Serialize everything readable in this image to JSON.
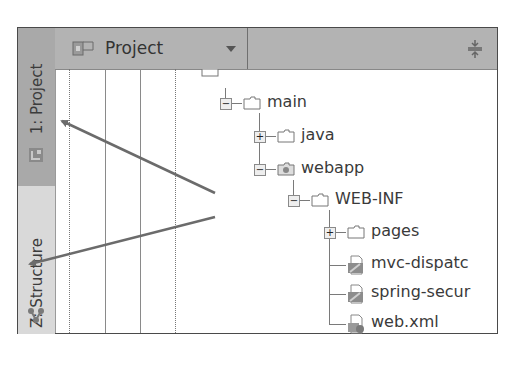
{
  "side_tabs": [
    {
      "label": "1: Project",
      "icon": "project-icon",
      "active": true
    },
    {
      "label": "Z: Structure",
      "icon": "structure-icon",
      "active": false
    }
  ],
  "toolbar": {
    "view_selector": {
      "label": "Project",
      "icon": "project-view-icon",
      "dropdown_icon": "chevron-down-icon"
    },
    "collapse_all_icon": "collapse-all-icon"
  },
  "tree": {
    "items": [
      {
        "label": "src",
        "type": "folder",
        "level": 0,
        "partial": true
      },
      {
        "label": "main",
        "type": "folder",
        "level": 1,
        "expanded": true
      },
      {
        "label": "java",
        "type": "folder",
        "level": 2,
        "expanded": false
      },
      {
        "label": "webapp",
        "type": "web-folder",
        "level": 2,
        "expanded": true
      },
      {
        "label": "WEB-INF",
        "type": "folder",
        "level": 3,
        "expanded": true
      },
      {
        "label": "pages",
        "type": "folder",
        "level": 4,
        "expanded": false
      },
      {
        "label": "mvc-dispatc",
        "type": "spring-xml",
        "level": 4
      },
      {
        "label": "spring-secur",
        "type": "spring-xml",
        "level": 4
      },
      {
        "label": "web.xml",
        "type": "web-xml",
        "level": 4
      }
    ]
  },
  "annotations": {
    "arrow_color": "#6b6b6b",
    "arrows": [
      {
        "from": [
          215,
          193
        ],
        "to": [
          60,
          120
        ],
        "points_to": "1: Project"
      },
      {
        "from": [
          215,
          217
        ],
        "to": [
          28,
          264
        ],
        "points_to": "Z: Structure"
      }
    ]
  }
}
